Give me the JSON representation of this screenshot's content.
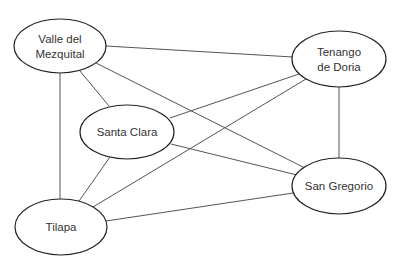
{
  "diagram": {
    "type": "undirected-graph",
    "nodes": [
      {
        "id": "vm",
        "lines": [
          "Valle del",
          "Mezquital"
        ],
        "cx": 60,
        "cy": 46,
        "rx": 46,
        "ry": 27
      },
      {
        "id": "td",
        "lines": [
          "Tenango",
          "de Doria"
        ],
        "cx": 339,
        "cy": 59,
        "rx": 47,
        "ry": 28
      },
      {
        "id": "sc",
        "lines": [
          "Santa Clara"
        ],
        "cx": 127,
        "cy": 132,
        "rx": 47,
        "ry": 27
      },
      {
        "id": "sg",
        "lines": [
          "San Gregorio"
        ],
        "cx": 339,
        "cy": 186,
        "rx": 47,
        "ry": 28
      },
      {
        "id": "ti",
        "lines": [
          "Tilapa"
        ],
        "cx": 61,
        "cy": 227,
        "rx": 46,
        "ry": 28
      }
    ],
    "edges": [
      {
        "from": "vm",
        "to": "td",
        "x1": 106,
        "y1": 46,
        "x2": 293,
        "y2": 57
      },
      {
        "from": "vm",
        "to": "sc",
        "x1": 80,
        "y1": 71,
        "x2": 109,
        "y2": 106
      },
      {
        "from": "vm",
        "to": "sg",
        "x1": 96,
        "y1": 63,
        "x2": 305,
        "y2": 168
      },
      {
        "from": "vm",
        "to": "ti",
        "x1": 60,
        "y1": 73,
        "x2": 60,
        "y2": 199
      },
      {
        "from": "td",
        "to": "sc",
        "x1": 299,
        "y1": 74,
        "x2": 170,
        "y2": 118
      },
      {
        "from": "td",
        "to": "ti",
        "x1": 306,
        "y1": 79,
        "x2": 93,
        "y2": 207
      },
      {
        "from": "td",
        "to": "sg",
        "x1": 339,
        "y1": 87,
        "x2": 339,
        "y2": 158
      },
      {
        "from": "sc",
        "to": "sg",
        "x1": 171,
        "y1": 144,
        "x2": 297,
        "y2": 175
      },
      {
        "from": "sc",
        "to": "ti",
        "x1": 110,
        "y1": 157,
        "x2": 79,
        "y2": 201
      },
      {
        "from": "ti",
        "to": "sg",
        "x1": 106,
        "y1": 221,
        "x2": 293,
        "y2": 193
      }
    ]
  }
}
